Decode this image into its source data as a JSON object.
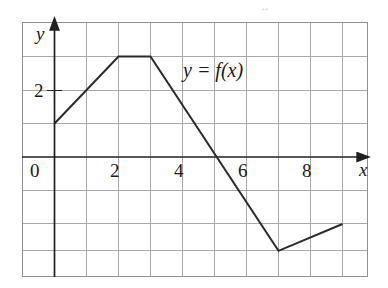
{
  "figure": {
    "kind": "piecewise-linear-graph",
    "artifact_top": "..",
    "curve_label": "y = f(x)",
    "axis_labels": {
      "x": "x",
      "y": "y"
    },
    "line_color": "#2b2b2b",
    "grid_color": "#a8a8a8",
    "frame_color": "#8f8f8f",
    "axis_color": "#1f1f1f",
    "background": "#ffffff"
  },
  "chart_data": {
    "type": "line",
    "title": "",
    "subtitle": "",
    "xlabel": "x",
    "ylabel": "y",
    "series": [
      {
        "name": "y = f(x)",
        "points": [
          [
            0,
            1
          ],
          [
            2,
            3
          ],
          [
            3,
            3
          ],
          [
            7,
            -2.8
          ],
          [
            9,
            -2
          ]
        ]
      }
    ],
    "x_ticks": [
      0,
      2,
      4,
      6,
      8
    ],
    "x_tick_labels": [
      "0",
      "2",
      "4",
      "6",
      "8"
    ],
    "y_ticks": [
      2
    ],
    "y_tick_labels": [
      "2"
    ],
    "xlim": [
      -1,
      9.8
    ],
    "ylim": [
      -3.2,
      4.6
    ],
    "grid": true,
    "grid_step_x": 1,
    "grid_step_y": 1,
    "legend": "none",
    "annotations": [
      {
        "text": "y = f(x)",
        "x": 4.05,
        "y": 2.55
      }
    ]
  },
  "ticks": {
    "x": [
      {
        "label": "0",
        "left": 30,
        "top": 161
      },
      {
        "label": "2",
        "left": 110,
        "top": 161
      },
      {
        "label": "4",
        "left": 174,
        "top": 161
      },
      {
        "label": "6",
        "left": 238,
        "top": 161
      },
      {
        "label": "8",
        "left": 302,
        "top": 161
      }
    ],
    "y": [
      {
        "label": "2",
        "left": 34,
        "top": 80
      }
    ]
  },
  "axis_names": {
    "x": {
      "label": "x",
      "left": 359,
      "top": 160
    },
    "y": {
      "label": "y",
      "left": 36,
      "top": 24
    }
  },
  "curve_label_pos": {
    "left": 183,
    "top": 60
  }
}
